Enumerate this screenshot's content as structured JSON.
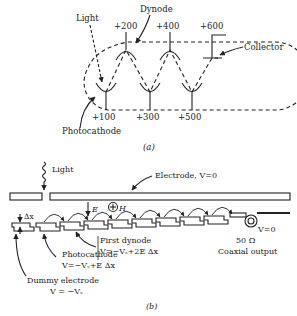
{
  "figure_a": {
    "caption": "(a)",
    "labels": {
      "light": "Light",
      "dynode": "Dynode",
      "collector": "Collector",
      "photocathode": "Photocathode"
    },
    "voltages": {
      "v100": "+100",
      "v200": "+200",
      "v300": "+300",
      "v400": "+400",
      "v500": "+500",
      "v600": "+600"
    }
  },
  "figure_b": {
    "caption": "(b)",
    "labels": {
      "light": "Light",
      "electrode": "Electrode, V=0",
      "delta_x": "Δx",
      "e_field": "E",
      "h_field": "H",
      "first_dynode": "First dynode",
      "first_dynode_v": "V=−Vₛ+2E Δx",
      "photocathode": "Photocathode",
      "photocathode_v": "V=−Vₛ+E Δx",
      "dummy": "Dummy electrode",
      "dummy_v": "V = −Vₛ",
      "v_zero": "V=0",
      "ohm": "50 Ω",
      "coax": "Coaxial output"
    }
  }
}
